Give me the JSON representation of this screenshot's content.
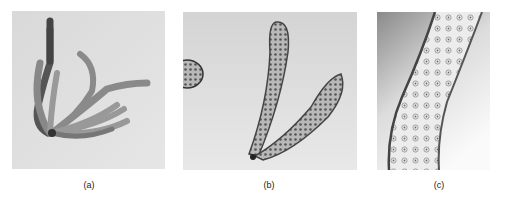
{
  "figure": {
    "panels": [
      {
        "id": "a",
        "label": "(a)",
        "subject": "cluster of branching tubular structures"
      },
      {
        "id": "b",
        "label": "(b)",
        "subject": "two curved tubes with dotted cell pattern"
      },
      {
        "id": "c",
        "label": "(c)",
        "subject": "magnified tube segment showing cells"
      }
    ]
  }
}
